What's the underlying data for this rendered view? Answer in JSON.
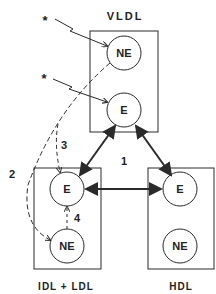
{
  "compartments": {
    "vldl": {
      "label": "VLDL",
      "nodes": {
        "ne": "NE",
        "e": "E"
      }
    },
    "idl_ldl": {
      "label": "IDL + LDL",
      "nodes": {
        "e": "E",
        "ne": "NE"
      }
    },
    "hdl": {
      "label": "HDL",
      "nodes": {
        "e": "E",
        "ne": "NE"
      }
    }
  },
  "markers": {
    "star1": "*",
    "star2": "*"
  },
  "pathways": {
    "p1": "1",
    "p2": "2",
    "p3": "3",
    "p4": "4"
  },
  "colors": {
    "stroke": "#2a2a2a",
    "background": "#ffffff"
  }
}
